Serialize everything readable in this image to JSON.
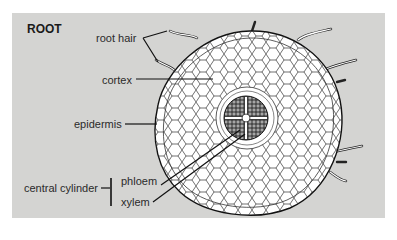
{
  "diagram": {
    "title": "ROOT",
    "labels": {
      "root_hair": "root hair",
      "cortex": "cortex",
      "epidermis": "epidermis",
      "central_cylinder": "central cylinder",
      "phloem": "phloem",
      "xylem": "xylem"
    },
    "colors": {
      "panel": "#d4d4d2",
      "cell_fill": "#ffffff",
      "line": "#1a1a1a"
    }
  }
}
